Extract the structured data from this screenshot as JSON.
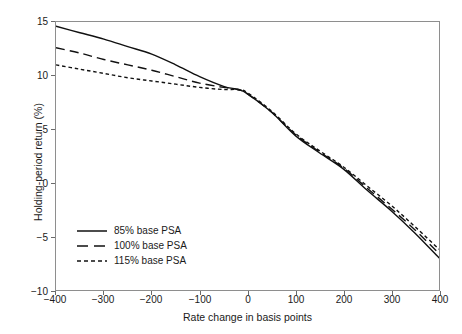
{
  "chart_data": {
    "type": "line",
    "title": "",
    "xlabel": "Rate change in basis points",
    "ylabel": "Holding-period return (%)",
    "xlim": [
      -400,
      400
    ],
    "ylim": [
      -10,
      15
    ],
    "xticks": [
      -400,
      -300,
      -200,
      -100,
      0,
      100,
      200,
      300,
      400
    ],
    "yticks": [
      -10,
      -5,
      0,
      5,
      10,
      15
    ],
    "xtick_labels": [
      "−400",
      "−300",
      "−200",
      "−100",
      "0",
      "100",
      "200",
      "300",
      "400"
    ],
    "ytick_labels": [
      "−10",
      "−5",
      "0",
      "5",
      "10",
      "15"
    ],
    "grid": false,
    "legend_position": "lower-left-inside",
    "x": [
      -400,
      -350,
      -300,
      -250,
      -200,
      -150,
      -100,
      -50,
      -20,
      0,
      50,
      100,
      150,
      200,
      250,
      300,
      350,
      400
    ],
    "series": [
      {
        "name": "85% base PSA",
        "style": "solid",
        "color": "#111111",
        "values": [
          14.6,
          14.0,
          13.4,
          12.7,
          12.0,
          11.0,
          9.9,
          9.0,
          8.7,
          8.3,
          6.6,
          4.4,
          2.8,
          1.3,
          -0.7,
          -2.6,
          -4.7,
          -7.0
        ]
      },
      {
        "name": "100% base PSA",
        "style": "dashed",
        "color": "#111111",
        "values": [
          12.6,
          12.1,
          11.5,
          11.0,
          10.5,
          9.9,
          9.3,
          8.9,
          8.7,
          8.3,
          6.6,
          4.5,
          2.9,
          1.4,
          -0.5,
          -2.4,
          -4.4,
          -6.6
        ]
      },
      {
        "name": "115% base PSA",
        "style": "dotted",
        "color": "#111111",
        "values": [
          11.0,
          10.6,
          10.2,
          9.8,
          9.5,
          9.2,
          8.9,
          8.7,
          8.7,
          8.4,
          6.7,
          4.6,
          3.0,
          1.5,
          -0.3,
          -2.1,
          -4.1,
          -6.2
        ]
      }
    ]
  },
  "legend": {
    "items": [
      {
        "label": "85% base PSA",
        "style": "solid"
      },
      {
        "label": "100% base PSA",
        "style": "dashed"
      },
      {
        "label": "115% base PSA",
        "style": "dotted"
      }
    ]
  }
}
